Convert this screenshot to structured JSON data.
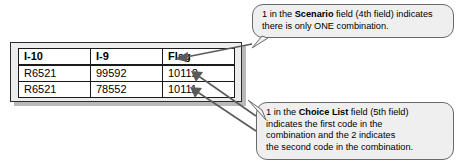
{
  "figure": {
    "background_color": "#ffffff"
  },
  "table": {
    "panel_fill": "#ededed",
    "border_color": "#1a1a1a",
    "headers": [
      "I-10",
      "I-9",
      "Flag"
    ],
    "rows": [
      [
        "R6521",
        "99592",
        "10112"
      ],
      [
        "R6521",
        "78552",
        "10111"
      ]
    ]
  },
  "callouts": [
    {
      "id": "scenario",
      "lines": [
        [
          {
            "text": "1 in the ",
            "bold": false
          },
          {
            "text": "Scenario",
            "bold": true
          },
          {
            "text": " field (4th field) indicates",
            "bold": false
          }
        ],
        [
          {
            "text": "there is only ONE combination.",
            "bold": false
          }
        ]
      ],
      "plain_text": "1 in the Scenario field (4th field) indicates there is only ONE combination."
    },
    {
      "id": "choice-list",
      "lines": [
        [
          {
            "text": "1 in the ",
            "bold": false
          },
          {
            "text": "Choice List",
            "bold": true
          },
          {
            "text": " field (5th field)",
            "bold": false
          }
        ],
        [
          {
            "text": "indicates the first code in the",
            "bold": false
          }
        ],
        [
          {
            "text": "combination and the 2 indicates",
            "bold": false
          }
        ],
        [
          {
            "text": "the second code in the combination.",
            "bold": false
          }
        ]
      ],
      "plain_text": "1 in the Choice List field (5th field) indicates the first code in the combination and the 2 indicates the second code in the combination."
    }
  ],
  "arrows": [
    {
      "name": "arrow-to-flag-header",
      "from": "callout-scenario",
      "to": "Flag header cell"
    },
    {
      "name": "arrow-to-row1-flag",
      "from": "callout-choice-list",
      "to": "10112"
    },
    {
      "name": "arrow-to-row2-flag",
      "from": "callout-choice-list",
      "to": "10111"
    }
  ]
}
